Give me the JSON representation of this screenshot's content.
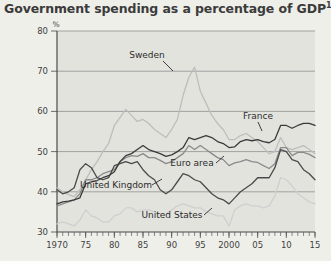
{
  "title": {
    "text": "Government spending as a percentage of GDP",
    "footnote_marker": "1"
  },
  "axis": {
    "y_unit": "%",
    "y_ticks": [
      "80",
      "70",
      "60",
      "50",
      "40",
      "30"
    ],
    "x_ticks": [
      "1970",
      "75",
      "80",
      "85",
      "90",
      "95",
      "2000",
      "05",
      "10",
      "15"
    ]
  },
  "labels": {
    "sweden": "Sweden",
    "france": "France",
    "euro_area": "Euro area",
    "united_kingdom": "United Kingdom",
    "united_states": "United States"
  },
  "colors": {
    "background": "#efefea",
    "plot_background": "#e3e3de",
    "gridline": "#8f8f8f",
    "france": "#3a3a3a",
    "united_kingdom": "#4a4a4a",
    "euro_area": "#8a8a8a",
    "sweden": "#bdbdbd",
    "united_states": "#cfcfcf",
    "title": "#3b3b3b"
  },
  "chart_data": {
    "type": "line",
    "title": "Government spending as a percentage of GDP",
    "xlabel": "",
    "ylabel": "%",
    "ylim": [
      30,
      80
    ],
    "xlim": [
      1970,
      2015
    ],
    "grid": true,
    "legend": "inline-annotations",
    "x": [
      1970,
      1971,
      1972,
      1973,
      1974,
      1975,
      1976,
      1977,
      1978,
      1979,
      1980,
      1981,
      1982,
      1983,
      1984,
      1985,
      1986,
      1987,
      1988,
      1989,
      1990,
      1991,
      1992,
      1993,
      1994,
      1995,
      1996,
      1997,
      1998,
      1999,
      2000,
      2001,
      2002,
      2003,
      2004,
      2005,
      2006,
      2007,
      2008,
      2009,
      2010,
      2011,
      2012,
      2013,
      2014,
      2015
    ],
    "series": [
      {
        "name": "Sweden",
        "color": "#bdbdbd",
        "values": [
          41.0,
          40.0,
          39.3,
          38.8,
          40.5,
          43.0,
          45.5,
          47.5,
          50.0,
          52.0,
          56.5,
          58.5,
          60.5,
          59.0,
          57.5,
          58.0,
          57.0,
          55.5,
          54.5,
          53.5,
          55.5,
          58.0,
          64.0,
          68.5,
          71.0,
          65.0,
          62.0,
          59.0,
          57.0,
          55.5,
          53.0,
          53.0,
          54.0,
          54.5,
          53.5,
          52.5,
          51.0,
          49.5,
          50.0,
          53.5,
          51.0,
          50.5,
          51.0,
          51.5,
          50.5,
          49.5
        ]
      },
      {
        "name": "France",
        "color": "#3a3a3a",
        "values": [
          37.0,
          37.5,
          37.7,
          38.0,
          38.5,
          42.0,
          42.5,
          42.8,
          43.5,
          44.0,
          45.0,
          47.5,
          49.0,
          49.5,
          50.5,
          51.5,
          50.5,
          50.0,
          49.5,
          48.8,
          49.2,
          50.0,
          51.0,
          53.5,
          53.0,
          53.5,
          54.0,
          53.5,
          52.5,
          52.0,
          51.0,
          51.2,
          52.5,
          53.0,
          52.7,
          53.0,
          52.5,
          52.2,
          53.0,
          56.5,
          56.5,
          55.8,
          56.5,
          57.0,
          57.0,
          56.5
        ]
      },
      {
        "name": "Euro area",
        "color": "#8a8a8a",
        "values": [
          36.5,
          37.0,
          37.5,
          38.0,
          39.5,
          43.0,
          43.0,
          43.5,
          44.5,
          45.0,
          45.5,
          47.5,
          48.5,
          49.0,
          48.8,
          49.5,
          48.5,
          48.5,
          47.8,
          47.0,
          47.5,
          48.5,
          49.5,
          51.5,
          50.5,
          51.5,
          50.5,
          49.5,
          48.5,
          48.0,
          46.5,
          47.2,
          47.5,
          48.0,
          47.5,
          47.3,
          46.5,
          45.8,
          47.0,
          51.0,
          51.0,
          49.0,
          49.8,
          49.8,
          49.3,
          48.5
        ]
      },
      {
        "name": "United Kingdom",
        "color": "#4a4a4a",
        "values": [
          40.5,
          39.5,
          40.0,
          41.0,
          45.5,
          47.0,
          46.0,
          43.5,
          43.0,
          43.5,
          46.5,
          47.0,
          47.5,
          47.0,
          47.5,
          45.5,
          44.0,
          43.0,
          40.5,
          39.5,
          40.5,
          42.5,
          44.5,
          44.0,
          43.0,
          42.5,
          41.0,
          39.5,
          38.5,
          38.0,
          37.0,
          38.5,
          40.0,
          41.0,
          42.0,
          43.5,
          43.5,
          43.5,
          46.0,
          50.5,
          50.0,
          48.0,
          47.5,
          45.5,
          44.5,
          43.0
        ]
      },
      {
        "name": "United States",
        "color": "#cfcfcf",
        "values": [
          32.0,
          32.5,
          32.0,
          31.5,
          33.0,
          35.5,
          34.0,
          33.5,
          32.5,
          32.5,
          34.0,
          34.5,
          36.0,
          36.0,
          35.0,
          35.5,
          35.5,
          35.0,
          34.5,
          34.5,
          35.5,
          36.5,
          37.0,
          36.5,
          36.0,
          36.0,
          35.0,
          34.5,
          34.0,
          34.0,
          31.5,
          35.5,
          36.5,
          37.0,
          36.5,
          36.5,
          36.0,
          36.5,
          39.0,
          43.5,
          43.0,
          41.5,
          39.5,
          38.5,
          37.5,
          37.0
        ]
      }
    ]
  }
}
